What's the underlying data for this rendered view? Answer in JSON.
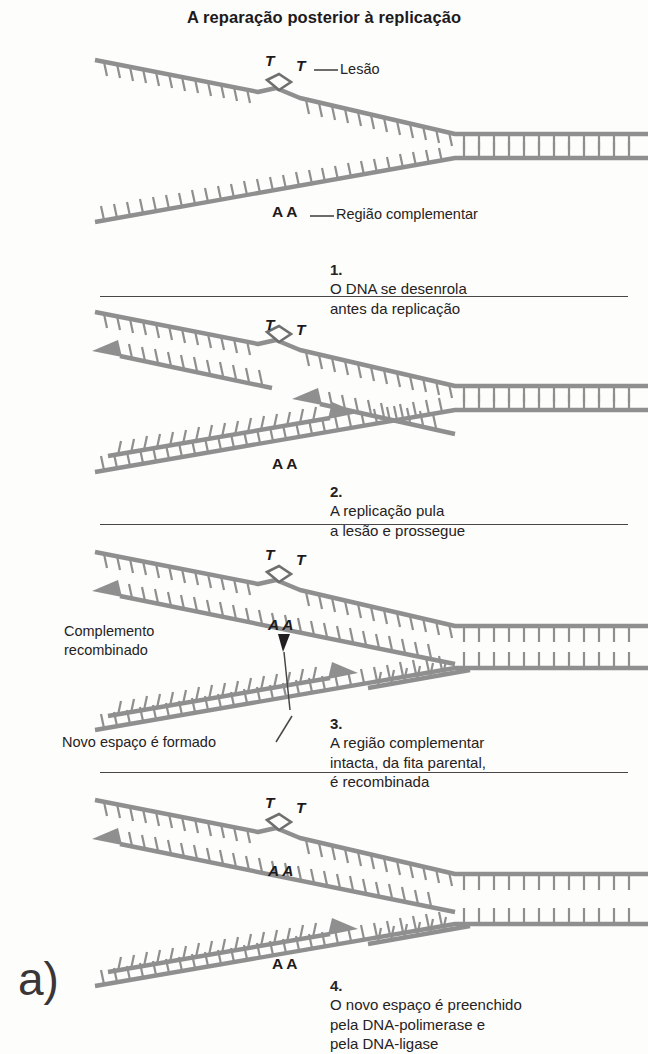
{
  "figure": {
    "title": "A reparação posterior à replicação",
    "panel_label": "a)"
  },
  "colors": {
    "background": "#fdfdfb",
    "strand": "#8f8f8f",
    "strand_dark": "#7a7a7a",
    "text": "#231f20",
    "rule": "#2a2627"
  },
  "panels": [
    {
      "id": "panel-1",
      "step_number": "1.",
      "caption": "O DNA se desenrola\nantes da replicação",
      "annotations": [
        {
          "name": "lesion-callout",
          "text": "Lesão"
        },
        {
          "name": "complementary-region-callout",
          "text": "Região complementar"
        }
      ],
      "bases": [
        {
          "name": "thymine-left",
          "text": "T",
          "style": "italic"
        },
        {
          "name": "thymine-right",
          "text": "T",
          "style": "italic"
        },
        {
          "name": "adenine-pair",
          "text": "A A",
          "style": "upright"
        }
      ]
    },
    {
      "id": "panel-2",
      "step_number": "2.",
      "caption": "A replicação pula\na lesão e prossegue",
      "annotations": [],
      "bases": [
        {
          "name": "thymine-left",
          "text": "T",
          "style": "italic"
        },
        {
          "name": "thymine-right",
          "text": "T",
          "style": "italic"
        },
        {
          "name": "adenine-pair",
          "text": "A A",
          "style": "upright"
        }
      ]
    },
    {
      "id": "panel-3",
      "step_number": "3.",
      "caption": "A região complementar\nintacta, da fita parental,\né recombinada",
      "annotations": [
        {
          "name": "recombined-complement-label",
          "text": "Complemento\nrecombinado"
        },
        {
          "name": "new-gap-label",
          "text": "Novo espaço é formado"
        }
      ],
      "bases": [
        {
          "name": "thymine-left",
          "text": "T",
          "style": "italic"
        },
        {
          "name": "thymine-right",
          "text": "T",
          "style": "italic"
        },
        {
          "name": "adenine-pair-italic",
          "text": "A A",
          "style": "italic"
        }
      ]
    },
    {
      "id": "panel-4",
      "step_number": "4.",
      "caption": "O novo espaço é preenchido\npela DNA-polimerase e\npela DNA-ligase",
      "annotations": [],
      "bases": [
        {
          "name": "thymine-left",
          "text": "T",
          "style": "italic"
        },
        {
          "name": "thymine-right",
          "text": "T",
          "style": "italic"
        },
        {
          "name": "adenine-pair-italic",
          "text": "A A",
          "style": "italic"
        },
        {
          "name": "adenine-pair-lower",
          "text": "A A",
          "style": "upright"
        }
      ]
    }
  ]
}
